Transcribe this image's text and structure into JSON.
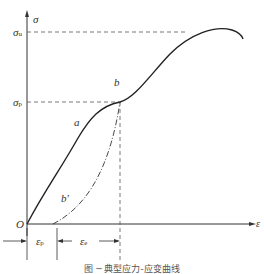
{
  "diagram": {
    "axis_y_label": "σ",
    "axis_x_label": "ε",
    "origin_label": "O",
    "sigma_u": {
      "main": "σ",
      "sub": "u"
    },
    "sigma_p": {
      "main": "σ",
      "sub": "p"
    },
    "curve_labels": {
      "a": "a",
      "b": "b",
      "b_prime": "b′"
    },
    "eps_p": {
      "main": "ε",
      "sub": "p"
    },
    "eps_e": {
      "main": "ε",
      "sub": "e"
    },
    "caption": "图 ─  典型应力-应变曲线"
  }
}
